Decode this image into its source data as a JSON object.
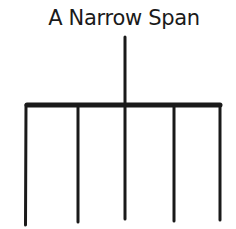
{
  "title": "A Narrow Span",
  "diagram": {
    "stroke_color": "#1a1a1a",
    "stem": {
      "x": 125,
      "y1": 37,
      "y2": 104
    },
    "bar": {
      "x1": 26,
      "x2": 221,
      "y": 105,
      "thickness": 5
    },
    "legs": [
      {
        "x": 26,
        "y_bottom": 225
      },
      {
        "x": 78,
        "y_bottom": 222
      },
      {
        "x": 125,
        "y_bottom": 219
      },
      {
        "x": 174,
        "y_bottom": 221
      },
      {
        "x": 220,
        "y_bottom": 220
      }
    ]
  }
}
